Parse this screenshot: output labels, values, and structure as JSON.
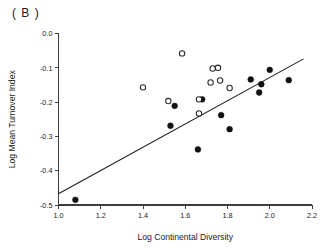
{
  "figure": {
    "panel_label": "( B )"
  },
  "chart_data": {
    "type": "scatter",
    "title": "",
    "subtitle": "",
    "xlabel": "Log Continental Diversity",
    "ylabel": "Log Mean Turnover Index",
    "xlim": [
      1.0,
      2.2
    ],
    "ylim": [
      -0.5,
      0.0
    ],
    "xticks": [
      1.0,
      1.2,
      1.4,
      1.6,
      1.8,
      2.0,
      2.2
    ],
    "xtick_labels": [
      "1.0",
      "1.2",
      "1.4",
      "1.6",
      "1.8",
      "2.0",
      "2.2"
    ],
    "yticks": [
      0.0,
      -0.1,
      -0.2,
      -0.3,
      -0.4,
      -0.5
    ],
    "ytick_labels": [
      "0.0",
      "-0.1",
      "-0.2",
      "-0.3",
      "-0.4",
      "-0.5"
    ],
    "grid": false,
    "legend": null,
    "legend_position": "none",
    "marker_colors": {
      "filled": "#111111",
      "open": "#ffffff",
      "open_edge": "#2a2a2a",
      "axis": "#3c3c3c",
      "fit_line": "#1a1a1a"
    },
    "series": [
      {
        "name": "filled",
        "marker": "filled-circle",
        "points": [
          {
            "x": 1.08,
            "y": -0.485
          },
          {
            "x": 1.55,
            "y": -0.211
          },
          {
            "x": 1.53,
            "y": -0.269
          },
          {
            "x": 1.66,
            "y": -0.338
          },
          {
            "x": 1.68,
            "y": -0.192
          },
          {
            "x": 1.77,
            "y": -0.238
          },
          {
            "x": 1.81,
            "y": -0.279
          },
          {
            "x": 1.91,
            "y": -0.134
          },
          {
            "x": 1.95,
            "y": -0.172
          },
          {
            "x": 1.96,
            "y": -0.148
          },
          {
            "x": 2.0,
            "y": -0.106
          },
          {
            "x": 2.09,
            "y": -0.136
          }
        ]
      },
      {
        "name": "open",
        "marker": "open-circle",
        "points": [
          {
            "x": 1.4,
            "y": -0.157
          },
          {
            "x": 1.52,
            "y": -0.197
          },
          {
            "x": 1.585,
            "y": -0.058
          },
          {
            "x": 1.665,
            "y": -0.233
          },
          {
            "x": 1.665,
            "y": -0.192
          },
          {
            "x": 1.72,
            "y": -0.143
          },
          {
            "x": 1.73,
            "y": -0.102
          },
          {
            "x": 1.755,
            "y": -0.1
          },
          {
            "x": 1.765,
            "y": -0.137
          },
          {
            "x": 1.81,
            "y": -0.159
          }
        ]
      }
    ],
    "fit_line": {
      "name": "regression-line",
      "x_start": 1.0,
      "y_start": -0.467,
      "x_end": 2.16,
      "y_end": -0.074
    }
  }
}
